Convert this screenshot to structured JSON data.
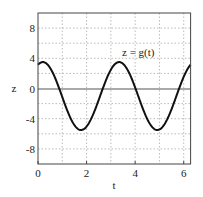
{
  "chart_data": {
    "type": "line",
    "title": "",
    "xlabel": "t",
    "ylabel": "z",
    "xlim": [
      0,
      6.283
    ],
    "ylim": [
      -10,
      10
    ],
    "xticks": [
      "0",
      "2",
      "4",
      "6"
    ],
    "yticks": [
      "8",
      "4",
      "0",
      "-4",
      "-8"
    ],
    "grid": true,
    "annotation": "z = g(t)",
    "series": [
      {
        "name": "z = g(t)",
        "x": [
          0,
          0.2,
          0.5,
          0.8,
          1.0,
          1.3,
          1.6,
          1.8,
          2.0,
          2.3,
          2.6,
          2.9,
          3.2,
          3.4,
          3.6,
          3.9,
          4.2,
          4.5,
          4.8,
          5.0,
          5.2,
          5.5,
          5.8,
          6.1,
          6.283
        ],
        "values": [
          3.1,
          3.5,
          3.1,
          1.6,
          0.2,
          -2.3,
          -4.6,
          -5.5,
          -5.2,
          -3.5,
          -0.9,
          1.9,
          3.4,
          3.5,
          2.8,
          0.4,
          -2.5,
          -4.8,
          -5.5,
          -5.1,
          -4.1,
          -1.7,
          1.2,
          3.0,
          3.1
        ]
      }
    ]
  }
}
